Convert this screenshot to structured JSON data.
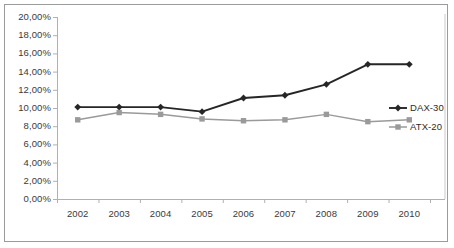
{
  "chart_data": {
    "type": "line",
    "title": "",
    "subtitle": "",
    "xlabel": "",
    "ylabel": "",
    "categories": [
      "2002",
      "2003",
      "2004",
      "2005",
      "2006",
      "2007",
      "2008",
      "2009",
      "2010"
    ],
    "series": [
      {
        "name": "DAX-30",
        "color": "#262626",
        "marker": "diamond",
        "values": [
          10.1,
          10.1,
          10.1,
          9.6,
          11.1,
          11.4,
          12.6,
          14.8,
          14.8
        ]
      },
      {
        "name": "ATX-20",
        "color": "#9a9a9a",
        "marker": "square",
        "values": [
          8.7,
          9.5,
          9.3,
          8.8,
          8.6,
          8.7,
          9.3,
          8.5,
          8.7
        ]
      }
    ],
    "ylim": [
      0,
      20
    ],
    "ytick_values": [
      0,
      2,
      4,
      6,
      8,
      10,
      12,
      14,
      16,
      18,
      20
    ],
    "ytick_labels": [
      "0,00%",
      "2,00%",
      "4,00%",
      "6,00%",
      "8,00%",
      "10,00%",
      "12,00%",
      "14,00%",
      "16,00%",
      "18,00%",
      "20,00%"
    ],
    "grid": false,
    "legend_position": "right",
    "axis_color": "#b0b0b0",
    "frame_color": "#9b9b9b",
    "background": "#ffffff"
  }
}
